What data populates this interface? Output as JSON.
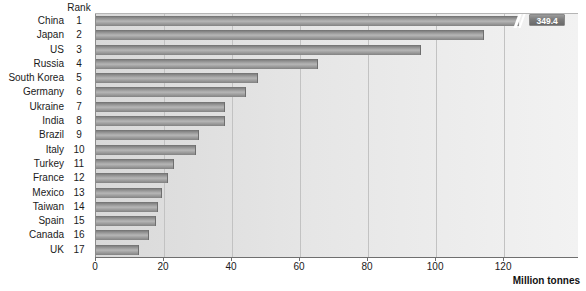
{
  "chart_data": {
    "type": "bar",
    "orientation": "horizontal",
    "title": "",
    "xlabel": "Million tonnes",
    "ylabel": "",
    "xlim": [
      0,
      142
    ],
    "xticks": [
      0,
      20,
      40,
      60,
      80,
      100,
      120
    ],
    "grid": true,
    "legend": false,
    "rank_header": "Rank",
    "categories": [
      "China",
      "Japan",
      "US",
      "Russia",
      "South Korea",
      "Germany",
      "Ukraine",
      "India",
      "Brazil",
      "Italy",
      "Turkey",
      "France",
      "Mexico",
      "Taiwan",
      "Spain",
      "Canada",
      "UK"
    ],
    "ranks": [
      "1",
      "2",
      "3",
      "4",
      "5",
      "6",
      "7",
      "8",
      "9",
      "10",
      "11",
      "12",
      "13",
      "14",
      "15",
      "16",
      "17"
    ],
    "values": [
      349.4,
      114.0,
      95.6,
      65.3,
      47.6,
      44.0,
      38.0,
      37.8,
      30.3,
      29.4,
      23.0,
      21.2,
      19.4,
      18.2,
      17.6,
      15.6,
      12.6
    ],
    "annotations": [
      {
        "category": "China",
        "label": "349.4",
        "note": "bar truncated with axis-break mark"
      }
    ],
    "colors": {
      "bar_dark": "#6f6f6f",
      "bar_light": "#b6b6b6",
      "plot_background_left": "#d9d9d9",
      "plot_background_right": "#f2f2f2",
      "gridline": "#c2c2c2",
      "axis": "#6f6f6f",
      "badge_background": "#7c7c7c",
      "badge_text": "#ffffff",
      "text": "#1a1a1a"
    }
  }
}
